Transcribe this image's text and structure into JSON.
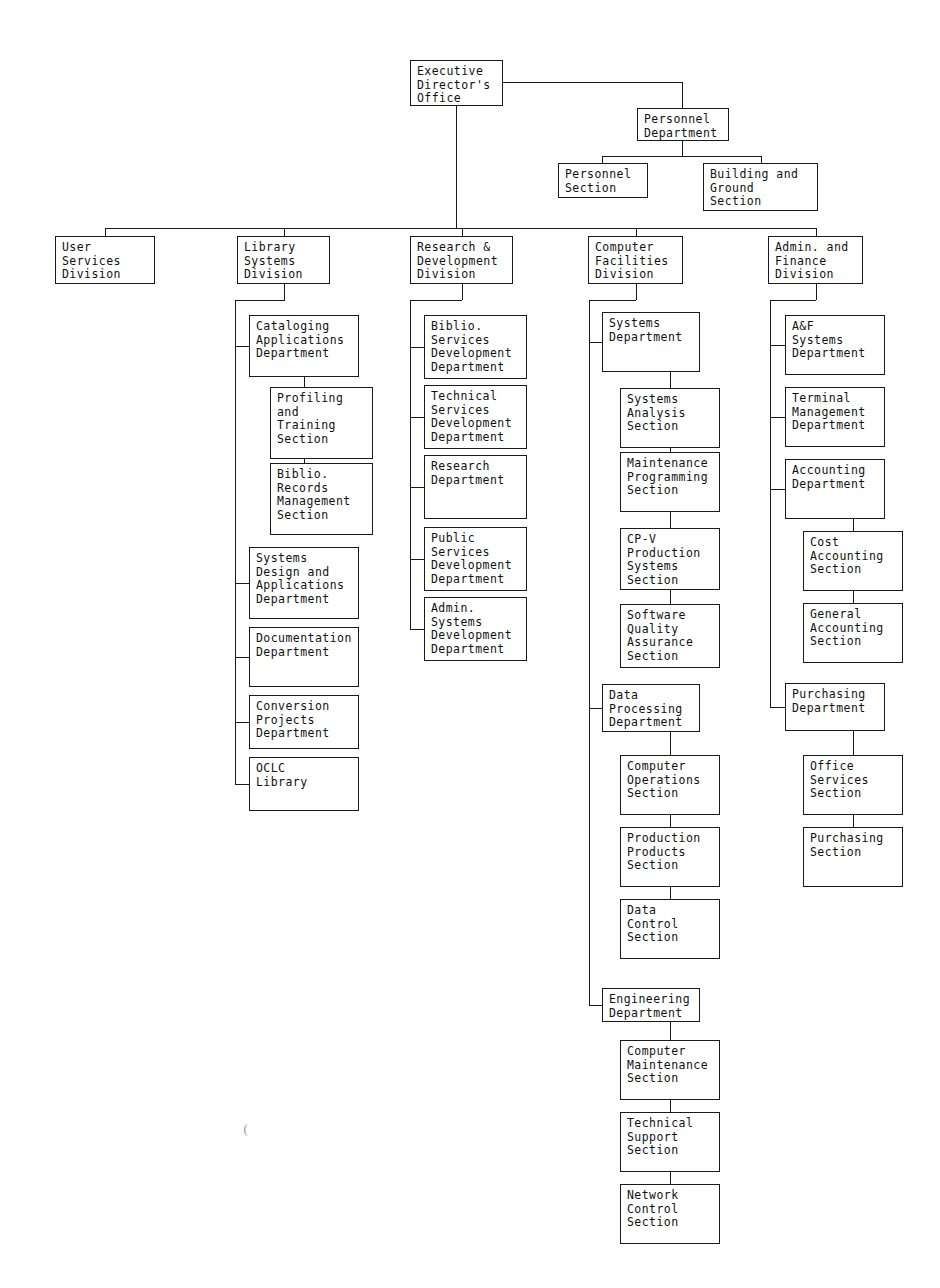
{
  "document": {
    "kind": "organization-chart",
    "title": "Executive Director's Office Organization Chart",
    "page_width": 940,
    "page_height": 1288,
    "line_color": "#1a1a1a",
    "text_color": "#111111",
    "background": "#ffffff"
  },
  "nodes": [
    {
      "id": "exec",
      "label": "Executive\nDirector's\nOffice",
      "x": 410,
      "y": 60,
      "w": 93,
      "h": 46,
      "level": "office"
    },
    {
      "id": "personnel_dept",
      "label": "Personnel\nDepartment",
      "x": 637,
      "y": 108,
      "w": 92,
      "h": 33,
      "level": "department"
    },
    {
      "id": "personnel_sec",
      "label": "Personnel\nSection",
      "x": 558,
      "y": 163,
      "w": 90,
      "h": 35,
      "level": "section"
    },
    {
      "id": "building_sec",
      "label": "Building and\nGround\nSection",
      "x": 703,
      "y": 163,
      "w": 115,
      "h": 48,
      "level": "section"
    },
    {
      "id": "user_div",
      "label": "User\nServices\nDivision",
      "x": 55,
      "y": 236,
      "w": 100,
      "h": 48,
      "level": "division"
    },
    {
      "id": "lib_div",
      "label": "Library\nSystems\nDivision",
      "x": 237,
      "y": 236,
      "w": 93,
      "h": 48,
      "level": "division"
    },
    {
      "id": "rd_div",
      "label": "Research &\nDevelopment\nDivision",
      "x": 410,
      "y": 236,
      "w": 103,
      "h": 48,
      "level": "division"
    },
    {
      "id": "cf_div",
      "label": "Computer\nFacilities\nDivision",
      "x": 588,
      "y": 236,
      "w": 95,
      "h": 48,
      "level": "division"
    },
    {
      "id": "af_div",
      "label": "Admin. and\nFinance\nDivision",
      "x": 768,
      "y": 236,
      "w": 95,
      "h": 48,
      "level": "division"
    },
    {
      "id": "cat_app",
      "label": "Cataloging\nApplications\nDepartment",
      "x": 249,
      "y": 315,
      "w": 110,
      "h": 62,
      "level": "department"
    },
    {
      "id": "profiling",
      "label": "Profiling\nand\nTraining\nSection",
      "x": 270,
      "y": 387,
      "w": 103,
      "h": 72,
      "level": "section"
    },
    {
      "id": "biblio_rec",
      "label": "Biblio.\nRecords\nManagement\nSection",
      "x": 270,
      "y": 463,
      "w": 103,
      "h": 72,
      "level": "section"
    },
    {
      "id": "sys_design",
      "label": "Systems\nDesign and\nApplications\nDepartment",
      "x": 249,
      "y": 547,
      "w": 110,
      "h": 72,
      "level": "department"
    },
    {
      "id": "documentation",
      "label": "Documentation\nDepartment",
      "x": 249,
      "y": 627,
      "w": 110,
      "h": 60,
      "level": "department"
    },
    {
      "id": "conversion",
      "label": "Conversion\nProjects\nDepartment",
      "x": 249,
      "y": 695,
      "w": 110,
      "h": 54,
      "level": "department"
    },
    {
      "id": "oclc",
      "label": "OCLC\nLibrary",
      "x": 249,
      "y": 757,
      "w": 110,
      "h": 54,
      "level": "department"
    },
    {
      "id": "biblio_serv",
      "label": "Biblio.\nServices\nDevelopment\nDepartment",
      "x": 424,
      "y": 315,
      "w": 103,
      "h": 64,
      "level": "department"
    },
    {
      "id": "tech_serv",
      "label": "Technical\nServices\nDevelopment\nDepartment",
      "x": 424,
      "y": 385,
      "w": 103,
      "h": 64,
      "level": "department"
    },
    {
      "id": "research_dept",
      "label": "Research\nDepartment",
      "x": 424,
      "y": 455,
      "w": 103,
      "h": 64,
      "level": "department"
    },
    {
      "id": "public_serv",
      "label": "Public\nServices\nDevelopment\nDepartment",
      "x": 424,
      "y": 527,
      "w": 103,
      "h": 64,
      "level": "department"
    },
    {
      "id": "admin_sys",
      "label": "Admin.\nSystems\nDevelopment\nDepartment",
      "x": 424,
      "y": 597,
      "w": 103,
      "h": 64,
      "level": "department"
    },
    {
      "id": "sys_dept",
      "label": "Systems\nDepartment",
      "x": 602,
      "y": 312,
      "w": 98,
      "h": 60,
      "level": "department"
    },
    {
      "id": "sys_analysis",
      "label": "Systems\nAnalysis\nSection",
      "x": 620,
      "y": 388,
      "w": 100,
      "h": 60,
      "level": "section"
    },
    {
      "id": "maint_prog",
      "label": "Maintenance\nProgramming\nSection",
      "x": 620,
      "y": 452,
      "w": 100,
      "h": 60,
      "level": "section"
    },
    {
      "id": "cpv",
      "label": "CP-V\nProduction\nSystems\nSection",
      "x": 620,
      "y": 528,
      "w": 100,
      "h": 62,
      "level": "section"
    },
    {
      "id": "sqa",
      "label": "Software\nQuality\nAssurance\nSection",
      "x": 620,
      "y": 604,
      "w": 100,
      "h": 64,
      "level": "section"
    },
    {
      "id": "data_proc",
      "label": "Data\nProcessing\nDepartment",
      "x": 602,
      "y": 684,
      "w": 98,
      "h": 48,
      "level": "department"
    },
    {
      "id": "comp_ops",
      "label": "Computer\nOperations\nSection",
      "x": 620,
      "y": 755,
      "w": 100,
      "h": 60,
      "level": "section"
    },
    {
      "id": "prod_prod",
      "label": "Production\nProducts\nSection",
      "x": 620,
      "y": 827,
      "w": 100,
      "h": 60,
      "level": "section"
    },
    {
      "id": "data_ctrl",
      "label": "Data\nControl\nSection",
      "x": 620,
      "y": 899,
      "w": 100,
      "h": 60,
      "level": "section"
    },
    {
      "id": "engineering",
      "label": "Engineering\nDepartment",
      "x": 602,
      "y": 988,
      "w": 98,
      "h": 34,
      "level": "department"
    },
    {
      "id": "comp_maint",
      "label": "Computer\nMaintenance\nSection",
      "x": 620,
      "y": 1040,
      "w": 100,
      "h": 60,
      "level": "section"
    },
    {
      "id": "tech_support",
      "label": "Technical\nSupport\nSection",
      "x": 620,
      "y": 1112,
      "w": 100,
      "h": 60,
      "level": "section"
    },
    {
      "id": "network_ctrl",
      "label": "Network\nControl\nSection",
      "x": 620,
      "y": 1184,
      "w": 100,
      "h": 60,
      "level": "section"
    },
    {
      "id": "af_sys",
      "label": "A&F\nSystems\nDepartment",
      "x": 785,
      "y": 315,
      "w": 100,
      "h": 60,
      "level": "department"
    },
    {
      "id": "terminal_mgmt",
      "label": "Terminal\nManagement\nDepartment",
      "x": 785,
      "y": 387,
      "w": 100,
      "h": 60,
      "level": "department"
    },
    {
      "id": "accounting",
      "label": "Accounting\nDepartment",
      "x": 785,
      "y": 459,
      "w": 100,
      "h": 60,
      "level": "department"
    },
    {
      "id": "cost_acct",
      "label": "Cost\nAccounting\nSection",
      "x": 803,
      "y": 531,
      "w": 100,
      "h": 60,
      "level": "section"
    },
    {
      "id": "general_acct",
      "label": "General\nAccounting\nSection",
      "x": 803,
      "y": 603,
      "w": 100,
      "h": 60,
      "level": "section"
    },
    {
      "id": "purch_dept",
      "label": "Purchasing\nDepartment",
      "x": 785,
      "y": 683,
      "w": 100,
      "h": 48,
      "level": "department"
    },
    {
      "id": "office_serv",
      "label": "Office\nServices\nSection",
      "x": 803,
      "y": 755,
      "w": 100,
      "h": 60,
      "level": "section"
    },
    {
      "id": "purch_sec",
      "label": "Purchasing\nSection",
      "x": 803,
      "y": 827,
      "w": 100,
      "h": 60,
      "level": "section"
    }
  ],
  "connectors": [
    {
      "name": "exec-to-personnel-horizontal",
      "type": "h",
      "x": 503,
      "y": 82,
      "len": 180
    },
    {
      "name": "exec-to-personnel-vertical",
      "type": "v",
      "x": 682,
      "y": 82,
      "len": 27
    },
    {
      "name": "personnel-dept-stem",
      "type": "v",
      "x": 682,
      "y": 141,
      "len": 15
    },
    {
      "name": "personnel-dept-bus",
      "type": "h",
      "x": 602,
      "y": 156,
      "len": 160
    },
    {
      "name": "personnel-section-drop",
      "type": "v",
      "x": 602,
      "y": 156,
      "len": 8
    },
    {
      "name": "building-ground-drop",
      "type": "v",
      "x": 761,
      "y": 156,
      "len": 8
    },
    {
      "name": "exec-main-stem",
      "type": "v",
      "x": 456,
      "y": 106,
      "len": 123
    },
    {
      "name": "divisions-bus",
      "type": "h",
      "x": 105,
      "y": 228,
      "len": 711
    },
    {
      "name": "user-div-drop",
      "type": "v",
      "x": 105,
      "y": 228,
      "len": 9
    },
    {
      "name": "lib-div-drop",
      "type": "v",
      "x": 284,
      "y": 228,
      "len": 9
    },
    {
      "name": "rd-div-drop",
      "type": "v",
      "x": 462,
      "y": 228,
      "len": 9
    },
    {
      "name": "cf-div-drop",
      "type": "v",
      "x": 636,
      "y": 228,
      "len": 9
    },
    {
      "name": "af-div-drop",
      "type": "v",
      "x": 816,
      "y": 228,
      "len": 9
    },
    {
      "name": "lib-div-stem",
      "type": "v",
      "x": 284,
      "y": 284,
      "len": 16
    },
    {
      "name": "lib-spine-elbow",
      "type": "h",
      "x": 235,
      "y": 300,
      "len": 50
    },
    {
      "name": "lib-spine",
      "type": "v",
      "x": 235,
      "y": 300,
      "len": 485
    },
    {
      "name": "lib-tap-cataloging",
      "type": "h",
      "x": 235,
      "y": 346,
      "len": 15
    },
    {
      "name": "lib-tap-sysdesign",
      "type": "h",
      "x": 235,
      "y": 583,
      "len": 15
    },
    {
      "name": "lib-tap-documentation",
      "type": "h",
      "x": 235,
      "y": 657,
      "len": 15
    },
    {
      "name": "lib-tap-conversion",
      "type": "h",
      "x": 235,
      "y": 722,
      "len": 15
    },
    {
      "name": "lib-tap-oclc",
      "type": "h",
      "x": 235,
      "y": 784,
      "len": 15
    },
    {
      "name": "cataloging-stem",
      "type": "v",
      "x": 304,
      "y": 377,
      "len": 11
    },
    {
      "name": "cataloging-sub-spine",
      "type": "v",
      "x": 304,
      "y": 459,
      "len": 5
    },
    {
      "name": "rd-div-stem",
      "type": "v",
      "x": 462,
      "y": 284,
      "len": 16
    },
    {
      "name": "rd-spine-elbow",
      "type": "h",
      "x": 410,
      "y": 300,
      "len": 52
    },
    {
      "name": "rd-spine",
      "type": "v",
      "x": 410,
      "y": 300,
      "len": 329
    },
    {
      "name": "rd-tap-biblio",
      "type": "h",
      "x": 410,
      "y": 347,
      "len": 15
    },
    {
      "name": "rd-tap-tech",
      "type": "h",
      "x": 410,
      "y": 417,
      "len": 15
    },
    {
      "name": "rd-tap-research",
      "type": "h",
      "x": 410,
      "y": 487,
      "len": 15
    },
    {
      "name": "rd-tap-public",
      "type": "h",
      "x": 410,
      "y": 559,
      "len": 15
    },
    {
      "name": "rd-tap-adminsys",
      "type": "h",
      "x": 410,
      "y": 629,
      "len": 15
    },
    {
      "name": "cf-div-stem",
      "type": "v",
      "x": 636,
      "y": 284,
      "len": 16
    },
    {
      "name": "cf-spine-elbow",
      "type": "h",
      "x": 589,
      "y": 300,
      "len": 47
    },
    {
      "name": "cf-spine",
      "type": "v",
      "x": 589,
      "y": 300,
      "len": 706
    },
    {
      "name": "cf-tap-systems",
      "type": "h",
      "x": 589,
      "y": 342,
      "len": 14
    },
    {
      "name": "cf-tap-dataproc",
      "type": "h",
      "x": 589,
      "y": 708,
      "len": 14
    },
    {
      "name": "cf-tap-engineering",
      "type": "h",
      "x": 589,
      "y": 1005,
      "len": 14
    },
    {
      "name": "sys-dept-stem",
      "type": "v",
      "x": 670,
      "y": 372,
      "len": 16
    },
    {
      "name": "sys-analysis-link",
      "type": "v",
      "x": 670,
      "y": 448,
      "len": 4
    },
    {
      "name": "maint-cpv-link",
      "type": "v",
      "x": 670,
      "y": 512,
      "len": 16
    },
    {
      "name": "cpv-sqa-link",
      "type": "v",
      "x": 670,
      "y": 590,
      "len": 14
    },
    {
      "name": "dataproc-stem",
      "type": "v",
      "x": 670,
      "y": 732,
      "len": 23
    },
    {
      "name": "compops-prodprod-link",
      "type": "v",
      "x": 670,
      "y": 815,
      "len": 12
    },
    {
      "name": "prodprod-datactrl-link",
      "type": "v",
      "x": 670,
      "y": 887,
      "len": 12
    },
    {
      "name": "engineering-stem",
      "type": "v",
      "x": 670,
      "y": 1022,
      "len": 18
    },
    {
      "name": "compmaint-techsup-link",
      "type": "v",
      "x": 670,
      "y": 1100,
      "len": 12
    },
    {
      "name": "techsup-network-link",
      "type": "v",
      "x": 670,
      "y": 1172,
      "len": 12
    },
    {
      "name": "af-div-stem",
      "type": "v",
      "x": 816,
      "y": 284,
      "len": 16
    },
    {
      "name": "af-spine-elbow",
      "type": "h",
      "x": 770,
      "y": 300,
      "len": 46
    },
    {
      "name": "af-spine",
      "type": "v",
      "x": 770,
      "y": 300,
      "len": 407
    },
    {
      "name": "af-tap-afsys",
      "type": "h",
      "x": 770,
      "y": 345,
      "len": 15
    },
    {
      "name": "af-tap-terminal",
      "type": "h",
      "x": 770,
      "y": 417,
      "len": 15
    },
    {
      "name": "af-tap-accounting",
      "type": "h",
      "x": 770,
      "y": 489,
      "len": 15
    },
    {
      "name": "af-tap-purchasing",
      "type": "h",
      "x": 770,
      "y": 707,
      "len": 15
    },
    {
      "name": "accounting-stem",
      "type": "v",
      "x": 853,
      "y": 519,
      "len": 12
    },
    {
      "name": "cost-general-link",
      "type": "v",
      "x": 853,
      "y": 591,
      "len": 12
    },
    {
      "name": "purchasing-stem",
      "type": "v",
      "x": 853,
      "y": 731,
      "len": 24
    },
    {
      "name": "office-purch-link",
      "type": "v",
      "x": 853,
      "y": 815,
      "len": 12
    }
  ],
  "marks": [
    {
      "name": "stray-pen-mark",
      "glyph": "(",
      "x": 243,
      "y": 1122
    }
  ]
}
